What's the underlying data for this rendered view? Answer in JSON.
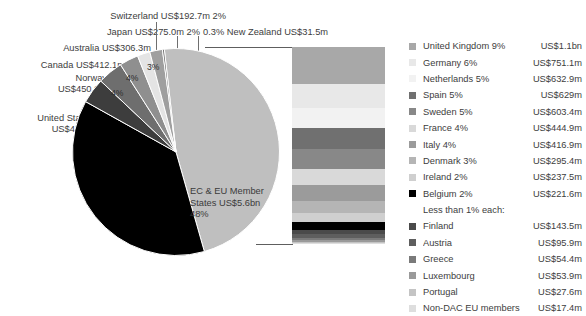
{
  "chart_data": {
    "type": "pie",
    "title": "",
    "units": "US dollars",
    "legend_position": "right",
    "note": "Pie of donor shares with an exploded stacked bar breaking out the EC & EU Member States slice into individual member countries.",
    "categories": [
      "EC & EU Member States",
      "United States",
      "Norway",
      "Canada",
      "Australia",
      "Japan",
      "Switzerland",
      "New Zealand"
    ],
    "values": [
      5600,
      4400,
      450.6,
      412.1,
      306.3,
      275.0,
      192.7,
      31.5
    ],
    "percentages": [
      48,
      38,
      4,
      4,
      3,
      2,
      2,
      0.3
    ],
    "slice_colors": [
      "#bfbfbf",
      "#000000",
      "#3d3d3d",
      "#6e6e6e",
      "#8f8f8f",
      "#e4e4e4",
      "#9f9f9f",
      "#6e6e6e"
    ],
    "slices": [
      {
        "name": "EC & EU Member States",
        "value_label": "US$5.6bn",
        "pct_label": "48%",
        "value_musd": 5600,
        "pct": 48,
        "color": "#bfbfbf"
      },
      {
        "name": "United States",
        "value_label": "US$4.4bn",
        "pct_label": "",
        "value_musd": 4400,
        "pct": 38,
        "color": "#000000"
      },
      {
        "name": "Norway",
        "value_label": "US$450.6m",
        "pct_label": "4%",
        "value_musd": 450.6,
        "pct": 4,
        "color": "#3d3d3d"
      },
      {
        "name": "Canada",
        "value_label": "US$412.1m",
        "pct_label": "4%",
        "value_musd": 412.1,
        "pct": 4,
        "color": "#6e6e6e"
      },
      {
        "name": "Australia",
        "value_label": "US$306.3m",
        "pct_label": "3%",
        "value_musd": 306.3,
        "pct": 3,
        "color": "#8f8f8f"
      },
      {
        "name": "Japan",
        "value_label": "US$275.0m",
        "pct_label": "2%",
        "value_musd": 275.0,
        "pct": 2,
        "color": "#e4e4e4"
      },
      {
        "name": "Switzerland",
        "value_label": "US$192.7m",
        "pct_label": "2%",
        "value_musd": 192.7,
        "pct": 2,
        "color": "#9f9f9f"
      },
      {
        "name": "New Zealand",
        "value_label": "US$31.5m",
        "pct_label": "0.3%",
        "value_musd": 31.5,
        "pct": 0.3,
        "color": "#6e6e6e"
      }
    ],
    "breakout_bar": {
      "type": "stacked_bar",
      "of_slice": "EC & EU Member States",
      "total_label": "US$5.6bn",
      "segments": [
        {
          "name": "United Kingdom",
          "pct": 9,
          "value_musd": 1100,
          "color": "#a8a8a8"
        },
        {
          "name": "Germany",
          "pct": 6,
          "value_musd": 751.1,
          "color": "#e8e8e8"
        },
        {
          "name": "Netherlands",
          "pct": 5,
          "value_musd": 632.9,
          "color": "#f2f2f2"
        },
        {
          "name": "Spain",
          "pct": 5,
          "value_musd": 629,
          "color": "#707070"
        },
        {
          "name": "Sweden",
          "pct": 5,
          "value_musd": 603.4,
          "color": "#888888"
        },
        {
          "name": "France",
          "pct": 4,
          "value_musd": 444.9,
          "color": "#d9d9d9"
        },
        {
          "name": "Italy",
          "pct": 4,
          "value_musd": 416.9,
          "color": "#9b9b9b"
        },
        {
          "name": "Denmark",
          "pct": 3,
          "value_musd": 295.4,
          "color": "#b5b5b5"
        },
        {
          "name": "Ireland",
          "pct": 2,
          "value_musd": 237.5,
          "color": "#cfcfcf"
        },
        {
          "name": "Belgium",
          "pct": 2,
          "value_musd": 221.6,
          "color": "#000000"
        },
        {
          "name": "Finland",
          "pct": 1,
          "value_musd": 143.5,
          "color": "#4a4a4a"
        },
        {
          "name": "Austria",
          "pct": 1,
          "value_musd": 95.9,
          "color": "#5e5e5e"
        },
        {
          "name": "Greece",
          "pct": 0.5,
          "value_musd": 54.4,
          "color": "#7a7a7a"
        },
        {
          "name": "Luxembourg",
          "pct": 0.5,
          "value_musd": 53.9,
          "color": "#9a9a9a"
        },
        {
          "name": "Portugal",
          "pct": 0.3,
          "value_musd": 27.6,
          "color": "#c4c4c4"
        },
        {
          "name": "Non-DAC EU members",
          "pct": 0.2,
          "value_musd": 17.4,
          "color": "#dedede"
        }
      ]
    }
  },
  "callouts": [
    {
      "id": "switzerland",
      "text": "Switzerland US$192.7m 2%"
    },
    {
      "id": "japan",
      "text": "Japan US$275.0m 2%"
    },
    {
      "id": "new-zealand",
      "text": "0.3% New Zealand US$31.5m"
    },
    {
      "id": "australia",
      "text": "Australia US$306.3m"
    },
    {
      "id": "canada",
      "text": "Canada US$412.1m"
    },
    {
      "id": "norway-line1",
      "text": "Norway"
    },
    {
      "id": "norway-line2",
      "text": "US$450.6m"
    },
    {
      "id": "united-states-line1",
      "text": "United States"
    },
    {
      "id": "united-states-line2",
      "text": "US$4.4bn"
    }
  ],
  "pie_labels": {
    "center_line1": "EC & EU Member",
    "center_line2": "States US$5.6bn",
    "center_line3": "48%",
    "pct_norway": "4%",
    "pct_canada": "4%",
    "pct_australia": "3%"
  },
  "legend": {
    "subheading": "Less than 1% each:",
    "rows": [
      {
        "name": "United Kingdom 9%",
        "value": "US$1.1bn",
        "color": "#a8a8a8"
      },
      {
        "name": "Germany 6%",
        "value": "US$751.1m",
        "color": "#e8e8e8"
      },
      {
        "name": "Netherlands 5%",
        "value": "US$632.9m",
        "color": "#f2f2f2"
      },
      {
        "name": "Spain 5%",
        "value": "US$629m",
        "color": "#707070"
      },
      {
        "name": "Sweden 5%",
        "value": "US$603.4m",
        "color": "#888888"
      },
      {
        "name": "France 4%",
        "value": "US$444.9m",
        "color": "#d9d9d9"
      },
      {
        "name": "Italy 4%",
        "value": "US$416.9m",
        "color": "#9b9b9b"
      },
      {
        "name": "Denmark 3%",
        "value": "US$295.4m",
        "color": "#b5b5b5"
      },
      {
        "name": "Ireland 2%",
        "value": "US$237.5m",
        "color": "#cfcfcf"
      },
      {
        "name": "Belgium 2%",
        "value": "US$221.6m",
        "color": "#000000"
      }
    ],
    "rows_sub": [
      {
        "name": "Finland",
        "value": "US$143.5m",
        "color": "#4a4a4a"
      },
      {
        "name": "Austria",
        "value": "US$95.9m",
        "color": "#5e5e5e"
      },
      {
        "name": "Greece",
        "value": "US$54.4m",
        "color": "#7a7a7a"
      },
      {
        "name": "Luxembourg",
        "value": "US$53.9m",
        "color": "#9a9a9a"
      },
      {
        "name": "Portugal",
        "value": "US$27.6m",
        "color": "#c4c4c4"
      },
      {
        "name": "Non-DAC EU members",
        "value": "US$17.4m",
        "color": "#dedede"
      }
    ]
  }
}
